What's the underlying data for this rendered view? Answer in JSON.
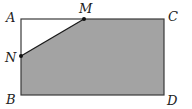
{
  "figure": {
    "type": "geometry",
    "shape": "rectangle ABCD with shaded pentagon",
    "colors": {
      "fill": "#a3a3a3",
      "stroke": "#3a3a3a",
      "point": "#111111",
      "label": "#222222"
    },
    "points": {
      "A": {
        "label": "A",
        "x": 21,
        "y": 19
      },
      "M": {
        "label": "M",
        "x": 84,
        "y": 19
      },
      "C": {
        "label": "C",
        "x": 164,
        "y": 19
      },
      "N": {
        "label": "N",
        "x": 21,
        "y": 56
      },
      "B": {
        "label": "B",
        "x": 21,
        "y": 95
      },
      "D": {
        "label": "D",
        "x": 164,
        "y": 95
      }
    },
    "shaded_region": "M-C-D-B-N",
    "segments": [
      "AM",
      "MC",
      "CD",
      "DB",
      "BN",
      "NA",
      "MN"
    ]
  }
}
